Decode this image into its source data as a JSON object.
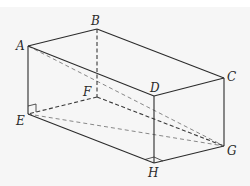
{
  "diagram": {
    "type": "cuboid",
    "colors": {
      "background": "#f6f6f6",
      "edge": "#2b2b2b",
      "diagonal": "#7a7a7a"
    },
    "vertices": {
      "A": {
        "label": "A",
        "x": 28,
        "y": 46
      },
      "B": {
        "label": "B",
        "x": 97,
        "y": 29
      },
      "C": {
        "label": "C",
        "x": 224,
        "y": 78
      },
      "D": {
        "label": "D",
        "x": 154,
        "y": 96
      },
      "E": {
        "label": "E",
        "x": 28,
        "y": 114
      },
      "F": {
        "label": "F",
        "x": 97,
        "y": 97
      },
      "G": {
        "label": "G",
        "x": 224,
        "y": 146
      },
      "H": {
        "label": "H",
        "x": 154,
        "y": 163
      }
    },
    "visible_edges": [
      "AB",
      "BC",
      "CD",
      "DA",
      "AE",
      "DH",
      "CG",
      "EH",
      "HG"
    ],
    "hidden_edges": [
      "BF",
      "FE",
      "FG"
    ],
    "diagonals": [
      "AG",
      "EG"
    ],
    "right_angle_markers": [
      "E",
      "H"
    ]
  }
}
